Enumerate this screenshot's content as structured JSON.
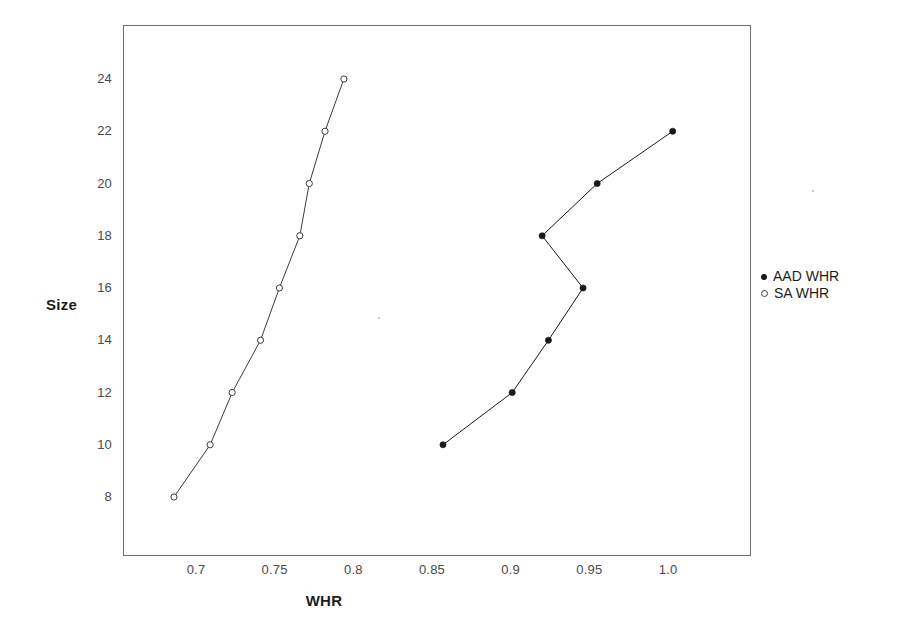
{
  "chart_data": {
    "type": "line",
    "title": "",
    "xlabel": "WHR",
    "ylabel": "Size",
    "xlim": [
      0.665,
      1.065
    ],
    "ylim": [
      7.0,
      25.3
    ],
    "xticks": [
      "0.7",
      "0.75",
      "0.8",
      "0.85",
      "0.9",
      "0.95",
      "1.0"
    ],
    "xtick_values": [
      0.7,
      0.75,
      0.8,
      0.85,
      0.9,
      0.95,
      1.0
    ],
    "yticks": [
      "8",
      "10",
      "12",
      "14",
      "16",
      "18",
      "20",
      "22",
      "24"
    ],
    "ytick_values": [
      8,
      10,
      12,
      14,
      16,
      18,
      20,
      22,
      24
    ],
    "grid": false,
    "legend_position": "right",
    "series": [
      {
        "name": "AAD WHR",
        "marker": "filled-circle",
        "color": "#1a1a1a",
        "x": [
          0.857,
          0.901,
          0.924,
          0.946,
          0.92,
          0.955,
          1.003
        ],
        "y": [
          10,
          12,
          14,
          16,
          18,
          20,
          22
        ]
      },
      {
        "name": "SA WHR",
        "marker": "open-circle",
        "color": "#3c3c3c",
        "x": [
          0.686,
          0.709,
          0.723,
          0.741,
          0.753,
          0.766,
          0.772,
          0.782,
          0.794
        ],
        "y": [
          8,
          10,
          12,
          14,
          16,
          18,
          20,
          22,
          24
        ]
      }
    ]
  },
  "legend": {
    "items": [
      {
        "label": "AAD WHR",
        "marker": "filled-circle"
      },
      {
        "label": "SA WHR",
        "marker": "open-circle"
      }
    ]
  },
  "axes": {
    "x_title": "WHR",
    "y_title": "Size"
  }
}
